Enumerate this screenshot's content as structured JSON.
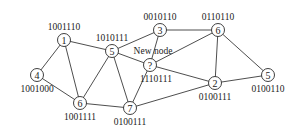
{
  "diagram": {
    "colors": {
      "stroke": "#2a2a2a",
      "text": "#222222",
      "background": "#ffffff"
    },
    "nodes": [
      {
        "key": "n1",
        "label": "1",
        "code": "1001110",
        "x": 64,
        "y": 40,
        "code_pos": "above"
      },
      {
        "key": "n4",
        "label": "4",
        "code": "1001000",
        "x": 37,
        "y": 75,
        "code_pos": "below"
      },
      {
        "key": "n6a",
        "label": "6",
        "code": "1001111",
        "x": 80,
        "y": 103,
        "code_pos": "below"
      },
      {
        "key": "n5a",
        "label": "5",
        "code": "1010111",
        "x": 112,
        "y": 51,
        "code_pos": "above"
      },
      {
        "key": "n7",
        "label": "7",
        "code": "0100111",
        "x": 130,
        "y": 108,
        "code_pos": "below"
      },
      {
        "key": "n3",
        "label": "3",
        "code": "0010110",
        "x": 160,
        "y": 30,
        "code_pos": "above"
      },
      {
        "key": "nq",
        "label": "?",
        "code": "1110111",
        "x": 150,
        "y": 65,
        "code_pos": "below-right",
        "annotation": "New node"
      },
      {
        "key": "n6b",
        "label": "6",
        "code": "0110110",
        "x": 218,
        "y": 30,
        "code_pos": "above"
      },
      {
        "key": "n2",
        "label": "2",
        "code": "0100111",
        "x": 215,
        "y": 83,
        "code_pos": "below"
      },
      {
        "key": "n5b",
        "label": "5",
        "code": "0100110",
        "x": 268,
        "y": 75,
        "code_pos": "below"
      }
    ],
    "edges": [
      [
        "n1",
        "n5a"
      ],
      [
        "n1",
        "n4"
      ],
      [
        "n1",
        "n6a"
      ],
      [
        "n4",
        "n6a"
      ],
      [
        "n6a",
        "n5a"
      ],
      [
        "n6a",
        "n7"
      ],
      [
        "n5a",
        "n7"
      ],
      [
        "n5a",
        "n3"
      ],
      [
        "n5a",
        "nq"
      ],
      [
        "n3",
        "n6b"
      ],
      [
        "n3",
        "nq"
      ],
      [
        "nq",
        "n6b"
      ],
      [
        "nq",
        "n7"
      ],
      [
        "nq",
        "n2"
      ],
      [
        "n6b",
        "n2"
      ],
      [
        "n6b",
        "n5b"
      ],
      [
        "n2",
        "n5b"
      ],
      [
        "n7",
        "n2"
      ]
    ],
    "new_node_label": "New node"
  }
}
